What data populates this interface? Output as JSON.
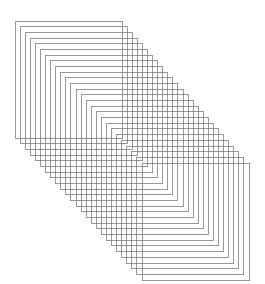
{
  "figure": {
    "title": "",
    "width": 265,
    "height": 284,
    "background_color": "#ffffff"
  },
  "chart_data": {
    "type": "scatter",
    "title": "",
    "subtitle": "",
    "xlabel": "",
    "ylabel": "",
    "grid": false,
    "legend": null,
    "xlim": [
      0,
      265
    ],
    "ylim": [
      0,
      284
    ],
    "geometry": {
      "shape": "rectangle",
      "count": 26,
      "rect_width": 107,
      "rect_height": 117,
      "first_origin_x": 15,
      "first_origin_y": 21,
      "offset_step_x": 5.08,
      "offset_step_y": 5.68,
      "stroke_color": "#6e6e6e",
      "stroke_width": 0.7,
      "fill": "none",
      "last_origin_x": 142,
      "last_origin_y": 163,
      "bounds_left": 15,
      "bounds_top": 21,
      "bounds_right": 249,
      "bounds_bottom": 280
    },
    "series": [
      {
        "name": "sheet-outlines",
        "values": [
          {
            "index": 0,
            "x": 15.0,
            "y": 21.0
          },
          {
            "index": 1,
            "x": 20.1,
            "y": 26.7
          },
          {
            "index": 2,
            "x": 25.2,
            "y": 32.4
          },
          {
            "index": 3,
            "x": 30.2,
            "y": 38.0
          },
          {
            "index": 4,
            "x": 35.3,
            "y": 43.7
          },
          {
            "index": 5,
            "x": 40.4,
            "y": 49.4
          },
          {
            "index": 6,
            "x": 45.5,
            "y": 55.1
          },
          {
            "index": 7,
            "x": 50.6,
            "y": 60.8
          },
          {
            "index": 8,
            "x": 55.6,
            "y": 66.4
          },
          {
            "index": 9,
            "x": 60.7,
            "y": 72.1
          },
          {
            "index": 10,
            "x": 65.8,
            "y": 77.8
          },
          {
            "index": 11,
            "x": 70.9,
            "y": 83.5
          },
          {
            "index": 12,
            "x": 76.0,
            "y": 89.2
          },
          {
            "index": 13,
            "x": 81.0,
            "y": 94.8
          },
          {
            "index": 14,
            "x": 86.1,
            "y": 100.5
          },
          {
            "index": 15,
            "x": 91.2,
            "y": 106.2
          },
          {
            "index": 16,
            "x": 96.3,
            "y": 111.9
          },
          {
            "index": 17,
            "x": 101.4,
            "y": 117.6
          },
          {
            "index": 18,
            "x": 106.4,
            "y": 123.2
          },
          {
            "index": 19,
            "x": 111.5,
            "y": 128.9
          },
          {
            "index": 20,
            "x": 116.6,
            "y": 134.6
          },
          {
            "index": 21,
            "x": 121.7,
            "y": 140.3
          },
          {
            "index": 22,
            "x": 126.8,
            "y": 146.0
          },
          {
            "index": 23,
            "x": 131.8,
            "y": 151.6
          },
          {
            "index": 24,
            "x": 136.9,
            "y": 157.3
          },
          {
            "index": 25,
            "x": 142.0,
            "y": 163.0
          }
        ]
      }
    ]
  }
}
